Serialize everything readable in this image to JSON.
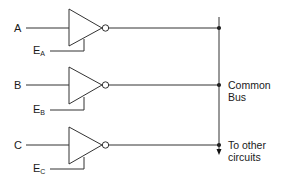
{
  "diagram": {
    "type": "tri-state buffer common bus",
    "colors": {
      "line": "#333333",
      "text": "#1a1a1a",
      "background": "#ffffff"
    },
    "gates": [
      {
        "id": "A",
        "input_label": "A",
        "enable_main": "E",
        "enable_sub": "A",
        "y": 28
      },
      {
        "id": "B",
        "input_label": "B",
        "enable_main": "E",
        "enable_sub": "B",
        "y": 85
      },
      {
        "id": "C",
        "input_label": "C",
        "enable_main": "E",
        "enable_sub": "C",
        "y": 145
      }
    ],
    "bus": {
      "label_line1": "Common",
      "label_line2": "Bus",
      "output_line1": "To other",
      "output_line2": "circuits"
    }
  }
}
